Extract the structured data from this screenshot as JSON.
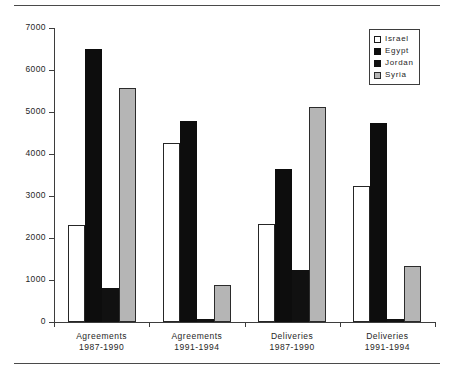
{
  "chart_data": {
    "type": "bar",
    "title": "",
    "xlabel": "",
    "ylabel": "",
    "ylim": [
      0,
      7000
    ],
    "yticks": [
      0,
      1000,
      2000,
      3000,
      4000,
      5000,
      6000,
      7000
    ],
    "ytick_labels": [
      "0",
      "1000",
      "2000",
      "3000",
      "4000",
      "5000",
      "6000",
      "7000"
    ],
    "grid": false,
    "legend_position": "top-right",
    "categories": [
      "Agreements 1987-1990",
      "Agreements 1991-1994",
      "Deliveries 1987-1990",
      "Deliveries 1991-1994"
    ],
    "category_lines": [
      {
        "line1": "Agreements",
        "line2": "1987-1990"
      },
      {
        "line1": "Agreements",
        "line2": "1991-1994"
      },
      {
        "line1": "Deliveries",
        "line2": "1987-1990"
      },
      {
        "line1": "Deliveries",
        "line2": "1991-1994"
      }
    ],
    "series": [
      {
        "name": "Israel",
        "color": "#ffffff",
        "values": [
          2300,
          4270,
          2340,
          3230
        ]
      },
      {
        "name": "Egypt",
        "color": "#0d0d0d",
        "values": [
          6510,
          4780,
          3650,
          4750
        ]
      },
      {
        "name": "Jordan",
        "color": "#111111",
        "values": [
          810,
          80,
          1250,
          60
        ]
      },
      {
        "name": "Syria",
        "color": "#b5b5b5",
        "values": [
          5580,
          880,
          5130,
          1340
        ]
      }
    ]
  },
  "legend": {
    "items": [
      {
        "label": "Israel",
        "swatch": "israel"
      },
      {
        "label": "Egypt",
        "swatch": "egypt"
      },
      {
        "label": "Jordan",
        "swatch": "jordan"
      },
      {
        "label": "Syria",
        "swatch": "syria"
      }
    ]
  }
}
